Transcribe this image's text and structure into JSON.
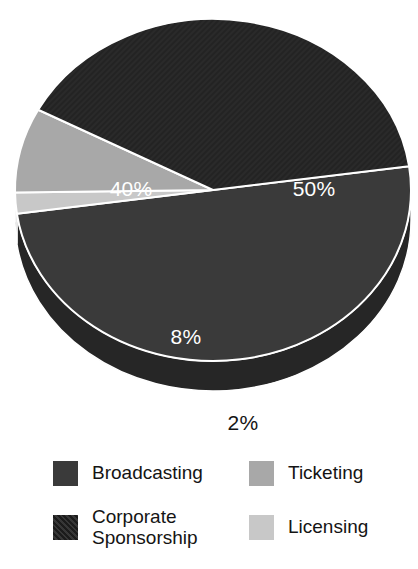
{
  "chart_data": {
    "type": "pie",
    "title": "",
    "subtitle": "",
    "xlabel": "",
    "ylabel": "",
    "legend_position": "bottom",
    "grid": false,
    "three_d": true,
    "units": "percent",
    "categories": [
      "Broadcasting",
      "Licensing",
      "Ticketing",
      "Corporate Sponsorship"
    ],
    "values": [
      50,
      2,
      8,
      40
    ],
    "labels": [
      "50%",
      "2%",
      "8%",
      "40%"
    ],
    "colors": [
      "#3a3a3a",
      "#c8c8c8",
      "#a8a8a8",
      "#2a2a2a"
    ],
    "slices": [
      {
        "name": "Broadcasting",
        "value": 50,
        "label": "50%",
        "color": "#3a3a3a",
        "side_color": "#262626",
        "label_color": "#ffffff",
        "label_position": "inside",
        "label_x": 314,
        "label_y": 190
      },
      {
        "name": "Licensing",
        "value": 2,
        "label": "2%",
        "color": "#c8c8c8",
        "side_color": "#9a9a9a",
        "label_color": "#141414",
        "label_position": "outside",
        "label_x": 243,
        "label_y": 424
      },
      {
        "name": "Ticketing",
        "value": 8,
        "label": "8%",
        "color": "#a8a8a8",
        "side_color": "#7e7e7e",
        "label_color": "#ffffff",
        "label_position": "inside",
        "label_x": 186,
        "label_y": 338
      },
      {
        "name": "Corporate Sponsorship",
        "value": 40,
        "label": "40%",
        "color": "#2a2a2a",
        "side_color": "#1c1c1c",
        "label_color": "#ffffff",
        "label_position": "inside",
        "label_x": 131,
        "label_y": 190
      }
    ]
  },
  "pie": {
    "center_x": 213,
    "center_y": 190,
    "radius_x": 198,
    "radius_y": 171,
    "depth": 30,
    "start_angle_deg": -8,
    "separator_color": "#ffffff",
    "separator_width": 2,
    "background": "#ffffff",
    "labels": {
      "broadcasting": "50%",
      "corporate_sponsorship": "40%",
      "ticketing": "8%",
      "licensing": "2%"
    }
  },
  "legend": {
    "items": [
      {
        "label": "Broadcasting",
        "color": "#3a3a3a",
        "swatch_name": "swatch-broadcasting"
      },
      {
        "label": "Ticketing",
        "color": "#a8a8a8",
        "swatch_name": "swatch-ticketing"
      },
      {
        "label": "Corporate\nSponsorship",
        "color": "#2a2a2a",
        "swatch_name": "swatch-corporate-sponsorship"
      },
      {
        "label": "Licensing",
        "color": "#c8c8c8",
        "swatch_name": "swatch-licensing"
      }
    ]
  }
}
